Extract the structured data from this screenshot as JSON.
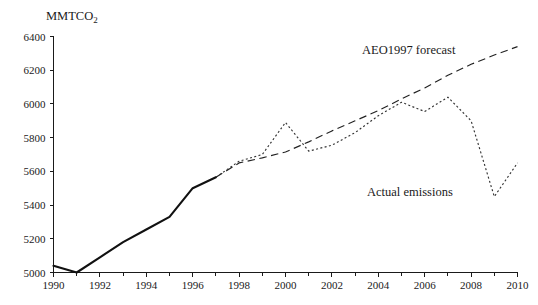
{
  "chart_data": {
    "type": "line",
    "title": "",
    "subtitle": "",
    "ylabel": "MMTCO",
    "ylabel_sub": "2",
    "xlabel": "",
    "xlim": [
      1990,
      2010
    ],
    "ylim": [
      5000,
      6400
    ],
    "grid": false,
    "legend_position": "inline-annotation",
    "y_ticks": [
      "6400",
      "6200",
      "6000",
      "5800",
      "5600",
      "5400",
      "5200",
      "5000"
    ],
    "y_tick_values": [
      6400,
      6200,
      6000,
      5800,
      5600,
      5400,
      5200,
      5000
    ],
    "x_ticks": [
      "1990",
      "1992",
      "1994",
      "1996",
      "1998",
      "2000",
      "2002",
      "2004",
      "2006",
      "2008",
      "2010"
    ],
    "x_tick_values": [
      1990,
      1992,
      1994,
      1996,
      1998,
      2000,
      2002,
      2004,
      2006,
      2008,
      2010
    ],
    "x_minor_tick_values": [
      1991,
      1993,
      1995,
      1997,
      1999,
      2001,
      2003,
      2005,
      2007,
      2009
    ],
    "series": [
      {
        "name": "Historical emissions",
        "style": "solid",
        "x": [
          1990,
          1991,
          1992,
          1993,
          1994,
          1995,
          1996,
          1997
        ],
        "values": [
          5040,
          5000,
          5090,
          5180,
          5255,
          5330,
          5500,
          5565
        ]
      },
      {
        "name": "Actual emissions",
        "label": "Actual emissions",
        "style": "dotted",
        "x": [
          1997,
          1998,
          1999,
          2000,
          2001,
          2002,
          2003,
          2004,
          2005,
          2006,
          2007,
          2008,
          2009,
          2010
        ],
        "values": [
          5565,
          5660,
          5700,
          5890,
          5720,
          5755,
          5830,
          5930,
          6010,
          5955,
          6040,
          5900,
          5450,
          5650
        ]
      },
      {
        "name": "AEO1997 forecast",
        "label": "AEO1997 forecast",
        "style": "dashed",
        "x": [
          1997,
          1998,
          1999,
          2000,
          2001,
          2002,
          2003,
          2004,
          2005,
          2006,
          2007,
          2008,
          2009,
          2010
        ],
        "values": [
          5565,
          5650,
          5680,
          5715,
          5775,
          5840,
          5900,
          5960,
          6030,
          6095,
          6170,
          6235,
          6290,
          6340
        ]
      }
    ],
    "annotations": [
      {
        "text": "AEO1997 forecast",
        "x_px": 362,
        "y_px": 54
      },
      {
        "text": "Actual emissions",
        "x_px": 367,
        "y_px": 196
      }
    ]
  }
}
